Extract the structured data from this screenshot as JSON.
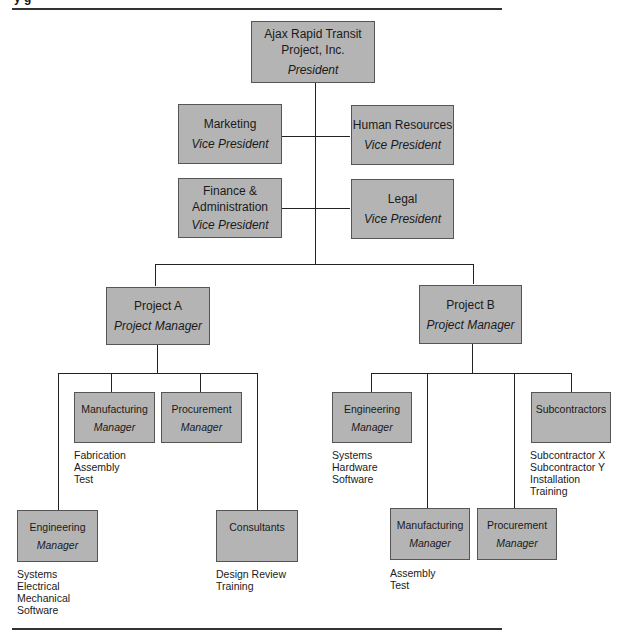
{
  "header": {
    "title_fragment": "y     g"
  },
  "chart": {
    "president": {
      "org": "Ajax Rapid Transit Project, Inc.",
      "line1": "Ajax Rapid Transit",
      "line2": "Project, Inc.",
      "role": "President"
    },
    "vps": [
      {
        "name": "Marketing",
        "role": "Vice President"
      },
      {
        "name": "Human Resources",
        "role": "Vice President"
      },
      {
        "name_line1": "Finance &",
        "name_line2": "Administration",
        "role": "Vice President"
      },
      {
        "name": "Legal",
        "role": "Vice President"
      }
    ],
    "project_a": {
      "name": "Project A",
      "role": "Project Manager",
      "units": [
        {
          "name": "Manufacturing",
          "role": "Manager",
          "notes": [
            "Fabrication",
            "Assembly",
            "Test"
          ]
        },
        {
          "name": "Procurement",
          "role": "Manager",
          "notes": []
        },
        {
          "name": "Engineering",
          "role": "Manager",
          "notes": [
            "Systems",
            "Electrical",
            "Mechanical",
            "Software"
          ]
        },
        {
          "name": "Consultants",
          "role": "",
          "notes": [
            "Design Review",
            "Training"
          ]
        }
      ]
    },
    "project_b": {
      "name": "Project B",
      "role": "Project Manager",
      "units": [
        {
          "name": "Engineering",
          "role": "Manager",
          "notes": [
            "Systems",
            "Hardware",
            "Software"
          ]
        },
        {
          "name": "Manufacturing",
          "role": "Manager",
          "notes": [
            "Assembly",
            "Test"
          ]
        },
        {
          "name": "Procurement",
          "role": "Manager",
          "notes": []
        },
        {
          "name": "Subcontractors",
          "role": "",
          "notes": [
            "Subcontractor X",
            "Subcontractor Y",
            "Installation",
            "Training"
          ]
        }
      ]
    }
  },
  "colors": {
    "box_fill": "#b4b4b4",
    "box_border": "#555555",
    "line": "#222222"
  }
}
